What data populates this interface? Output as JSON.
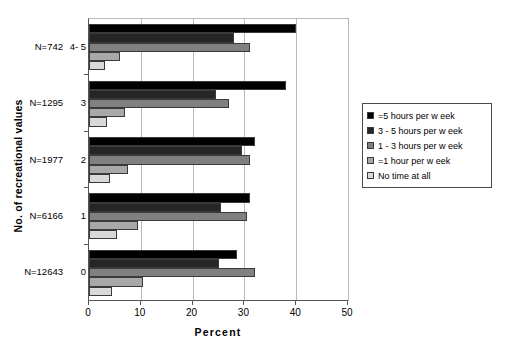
{
  "chart_data": {
    "type": "bar",
    "orientation": "horizontal",
    "title": "",
    "xlabel": "Percent",
    "ylabel": "No. of recreational values",
    "xlim": [
      0,
      50
    ],
    "xticks": [
      0,
      10,
      20,
      30,
      40,
      50
    ],
    "grid": true,
    "legend_position": "right",
    "categories": [
      "4- 5",
      "3",
      "2",
      "1",
      "0"
    ],
    "category_labels": [
      {
        "n": "N=742",
        "cat": "4- 5"
      },
      {
        "n": "N=1295",
        "cat": "3"
      },
      {
        "n": "N=1977",
        "cat": "2"
      },
      {
        "n": "N=6166",
        "cat": "1"
      },
      {
        "n": "N=12643",
        "cat": "0"
      }
    ],
    "series": [
      {
        "name": "=5 hours per w eek",
        "color": "#000000",
        "values": [
          40.0,
          38.0,
          32.0,
          31.0,
          28.5
        ]
      },
      {
        "name": "3 - 5 hours per w eek",
        "color": "#262626",
        "values": [
          28.0,
          24.5,
          29.5,
          25.5,
          25.0
        ]
      },
      {
        "name": "1 - 3 hours per w eek",
        "color": "#808080",
        "values": [
          31.0,
          27.0,
          31.0,
          30.5,
          32.0
        ]
      },
      {
        "name": "=1 hour per w eek",
        "color": "#a8a8a8",
        "values": [
          6.0,
          7.0,
          7.5,
          9.5,
          10.5
        ]
      },
      {
        "name": "No time at all",
        "color": "#d9d9d9",
        "values": [
          3.0,
          3.5,
          4.0,
          5.5,
          4.5
        ]
      }
    ]
  },
  "legend": {
    "items": [
      {
        "label": "=5 hours per w eek",
        "color": "#000000"
      },
      {
        "label": "3 - 5 hours per w eek",
        "color": "#262626"
      },
      {
        "label": "1 - 3 hours per w eek",
        "color": "#808080"
      },
      {
        "label": "=1 hour per w eek",
        "color": "#a8a8a8"
      },
      {
        "label": "No time at all",
        "color": "#d9d9d9"
      }
    ]
  },
  "axes": {
    "x_title": "Percent",
    "y_title": "No. of recreational values",
    "x_tick_labels": [
      "0",
      "10",
      "20",
      "30",
      "40",
      "50"
    ]
  }
}
